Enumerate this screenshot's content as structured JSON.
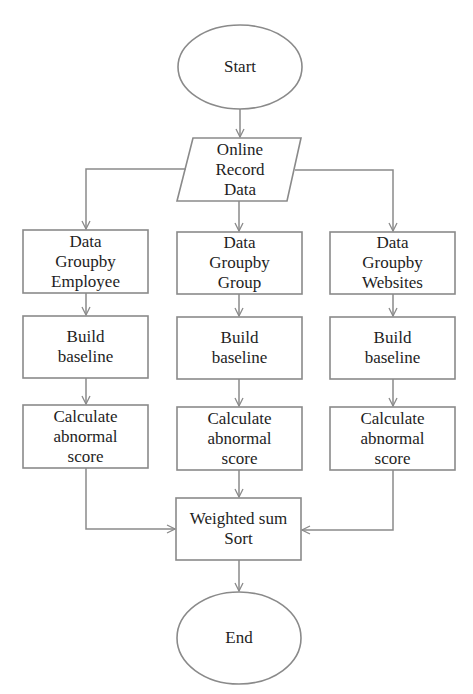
{
  "diagram": {
    "type": "flowchart",
    "nodes": {
      "start": {
        "shape": "ellipse",
        "lines": [
          "Start"
        ]
      },
      "input": {
        "shape": "parallelogram",
        "lines": [
          "Online",
          "Record",
          "Data"
        ]
      },
      "group_employee": {
        "shape": "rect",
        "lines": [
          "Data",
          "Groupby",
          "Employee"
        ]
      },
      "group_group": {
        "shape": "rect",
        "lines": [
          "Data",
          "Groupby",
          "Group"
        ]
      },
      "group_websites": {
        "shape": "rect",
        "lines": [
          "Data",
          "Groupby",
          "Websites"
        ]
      },
      "baseline_employee": {
        "shape": "rect",
        "lines": [
          "Build",
          "baseline"
        ]
      },
      "baseline_group": {
        "shape": "rect",
        "lines": [
          "Build",
          "baseline"
        ]
      },
      "baseline_websites": {
        "shape": "rect",
        "lines": [
          "Build",
          "baseline"
        ]
      },
      "score_employee": {
        "shape": "rect",
        "lines": [
          "Calculate",
          "abnormal",
          "score"
        ]
      },
      "score_group": {
        "shape": "rect",
        "lines": [
          "Calculate",
          "abnormal",
          "score"
        ]
      },
      "score_websites": {
        "shape": "rect",
        "lines": [
          "Calculate",
          "abnormal",
          "score"
        ]
      },
      "combine": {
        "shape": "rect",
        "lines": [
          "Weighted sum",
          "Sort"
        ]
      },
      "end": {
        "shape": "ellipse",
        "lines": [
          "End"
        ]
      }
    },
    "edges": [
      [
        "start",
        "input"
      ],
      [
        "input",
        "group_employee"
      ],
      [
        "input",
        "group_group"
      ],
      [
        "input",
        "group_websites"
      ],
      [
        "group_employee",
        "baseline_employee"
      ],
      [
        "group_group",
        "baseline_group"
      ],
      [
        "group_websites",
        "baseline_websites"
      ],
      [
        "baseline_employee",
        "score_employee"
      ],
      [
        "baseline_group",
        "score_group"
      ],
      [
        "baseline_websites",
        "score_websites"
      ],
      [
        "score_employee",
        "combine"
      ],
      [
        "score_group",
        "combine"
      ],
      [
        "score_websites",
        "combine"
      ],
      [
        "combine",
        "end"
      ]
    ],
    "colors": {
      "stroke": "#8a8a8a",
      "text": "#1e1e1e",
      "background": "#ffffff"
    }
  }
}
